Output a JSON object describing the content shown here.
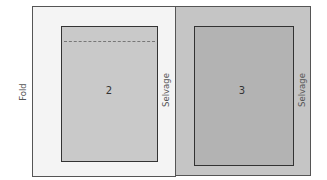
{
  "diagram": {
    "left_panel": {
      "edge_label_left": "Fold",
      "edge_label_right": "Selvage",
      "piece_number": "2",
      "fill": "#f4f4f4"
    },
    "right_panel": {
      "edge_label_right": "Selvage",
      "piece_number": "3",
      "fill": "#c5c5c5"
    },
    "colors": {
      "piece2_fill": "#c9c9c9",
      "piece3_fill": "#b3b3b3",
      "border": "#333333"
    }
  }
}
